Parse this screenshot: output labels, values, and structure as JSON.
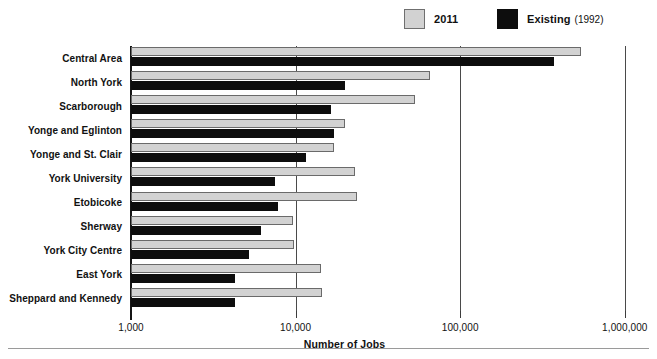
{
  "legend": {
    "items": [
      {
        "name": "2011",
        "sub": "",
        "color": "#d2d2d2",
        "key": "series2011"
      },
      {
        "name": "Existing",
        "sub": "(1992)",
        "color": "#0d0d0d",
        "key": "seriesExisting"
      }
    ]
  },
  "axis": {
    "xlabel": "Number of Jobs",
    "ticks": [
      "1,000",
      "10,000",
      "100,000",
      "1,000,000"
    ],
    "tick_values": [
      1000,
      10000,
      100000,
      1000000
    ]
  },
  "chart_data": {
    "type": "bar",
    "orientation": "horizontal",
    "title": "",
    "subtitle": "",
    "xlabel": "Number of Jobs",
    "ylabel": "",
    "xscale": "log",
    "xlim": [
      1000,
      1000000
    ],
    "grid": true,
    "legend_position": "top-right",
    "categories": [
      "Central Area",
      "North York",
      "Scarborough",
      "Yonge and Eglinton",
      "Yonge and St. Clair",
      "York University",
      "Etobicoke",
      "Sherway",
      "York City Centre",
      "East York",
      "Sheppard and Kennedy"
    ],
    "series": [
      {
        "name": "2011",
        "color": "#d2d2d2",
        "values": [
          540000,
          66000,
          53000,
          20000,
          17000,
          23000,
          23500,
          9700,
          9800,
          14300,
          14500
        ]
      },
      {
        "name": "Existing (1992)",
        "color": "#0d0d0d",
        "values": [
          370000,
          20000,
          16500,
          17000,
          11500,
          7500,
          7800,
          6200,
          5200,
          4300,
          4300
        ]
      }
    ]
  }
}
